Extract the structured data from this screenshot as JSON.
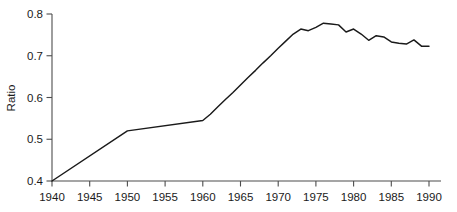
{
  "chart_data": {
    "type": "line",
    "title": "",
    "xlabel": "",
    "ylabel": "Ratio",
    "xlim": [
      1940,
      1990
    ],
    "ylim": [
      0.4,
      0.8
    ],
    "grid": false,
    "legend": false,
    "xticks": [
      1940,
      1945,
      1950,
      1955,
      1960,
      1965,
      1970,
      1975,
      1980,
      1985,
      1990
    ],
    "xtick_labels": [
      "1940",
      "1945",
      "1950",
      "1955",
      "1960",
      "1965",
      "1970",
      "1975",
      "1980",
      "1985",
      "1990"
    ],
    "yticks": [
      0.4,
      0.5,
      0.6,
      0.7,
      0.8
    ],
    "ytick_labels": [
      "0.4",
      "0.5",
      "0.6",
      "0.7",
      "0.8"
    ],
    "series": [
      {
        "name": "Ratio",
        "color": "#1a1a1a",
        "x": [
          1940,
          1950,
          1960,
          1961,
          1962,
          1963,
          1964,
          1965,
          1966,
          1967,
          1968,
          1969,
          1970,
          1971,
          1972,
          1973,
          1974,
          1975,
          1976,
          1977,
          1978,
          1979,
          1980,
          1981,
          1982,
          1983,
          1984,
          1985,
          1986,
          1987,
          1988,
          1989,
          1990
        ],
        "values": [
          0.4,
          0.52,
          0.545,
          0.56,
          0.578,
          0.595,
          0.612,
          0.63,
          0.648,
          0.665,
          0.683,
          0.7,
          0.718,
          0.735,
          0.752,
          0.764,
          0.76,
          0.768,
          0.778,
          0.776,
          0.774,
          0.757,
          0.764,
          0.752,
          0.737,
          0.748,
          0.745,
          0.733,
          0.73,
          0.728,
          0.738,
          0.723,
          0.723
        ]
      }
    ]
  },
  "axes": {
    "ylabel": "Ratio"
  }
}
